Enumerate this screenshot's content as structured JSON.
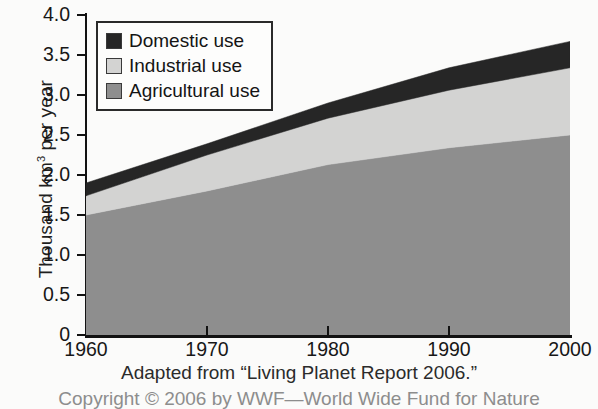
{
  "chart_data": {
    "type": "area",
    "title": "",
    "xlabel": "",
    "ylabel": "Thousand km3 per year",
    "ylabel_prefix": "Thousand km",
    "ylabel_sup": "3",
    "ylabel_suffix": " per year",
    "x": [
      1960,
      1970,
      1980,
      1990,
      2000
    ],
    "xlim": [
      1960,
      2000
    ],
    "ylim": [
      0,
      4.0
    ],
    "xtick_labels": [
      "1960",
      "1970",
      "1980",
      "1990",
      "2000"
    ],
    "ytick_labels": [
      "4.0",
      "3.5",
      "3.0",
      "2.5",
      "2.0",
      "1.5",
      "1.0",
      "0.5",
      "0"
    ],
    "ytick_values": [
      4.0,
      3.5,
      3.0,
      2.5,
      2.0,
      1.5,
      1.0,
      0.5,
      0
    ],
    "grid": false,
    "stacked": true,
    "legend_position": "top-left",
    "series": [
      {
        "name": "Agricultural use",
        "color": "#8e8e8e",
        "values": [
          1.5,
          1.8,
          2.13,
          2.34,
          2.5
        ]
      },
      {
        "name": "Industrial use",
        "color": "#d3d3d2",
        "values": [
          0.24,
          0.45,
          0.58,
          0.72,
          0.84
        ]
      },
      {
        "name": "Domestic use",
        "color": "#262626",
        "values": [
          0.16,
          0.14,
          0.19,
          0.28,
          0.33
        ]
      }
    ],
    "cumulative_totals": [
      1.9,
      2.39,
      2.9,
      3.34,
      3.67
    ],
    "annotations": []
  },
  "legend": {
    "items": [
      {
        "label": "Domestic use",
        "color": "#262626"
      },
      {
        "label": "Industrial use",
        "color": "#d3d3d2"
      },
      {
        "label": "Agricultural use",
        "color": "#8e8e8e"
      }
    ]
  },
  "caption": {
    "line1": "Adapted from “Living Planet Report 2006.”",
    "line2": "Copyright © 2006 by WWF—World Wide Fund for Nature"
  }
}
